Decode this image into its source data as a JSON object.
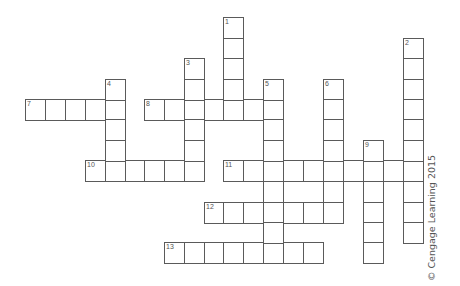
{
  "puzzle": {
    "grid_origin": {
      "x": 25,
      "y": 17
    },
    "col_x": [
      25,
      45,
      65,
      85,
      105,
      125,
      144,
      164,
      184,
      204,
      223,
      243,
      263,
      283,
      303,
      323,
      343,
      363,
      383,
      403
    ],
    "row_y": [
      17,
      38,
      58,
      79,
      99,
      119,
      140,
      160,
      181,
      202,
      222,
      242
    ],
    "cell_size": {
      "w": 21,
      "h": 22
    },
    "line_color": "#5a5a5a",
    "number_color": "#555555",
    "across": [
      {
        "number": "7",
        "row": 4,
        "col": 0,
        "length": 5
      },
      {
        "number": "8",
        "row": 4,
        "col": 6,
        "length": 7
      },
      {
        "number": "10",
        "row": 7,
        "col": 3,
        "length": 6
      },
      {
        "number": "11",
        "row": 7,
        "col": 10,
        "length": 10
      },
      {
        "number": "12",
        "row": 9,
        "col": 9,
        "length": 7
      },
      {
        "number": "13",
        "row": 11,
        "col": 7,
        "length": 8
      }
    ],
    "down": [
      {
        "number": "1",
        "row": 0,
        "col": 10,
        "length": 5
      },
      {
        "number": "2",
        "row": 1,
        "col": 19,
        "length": 10
      },
      {
        "number": "3",
        "row": 2,
        "col": 8,
        "length": 6
      },
      {
        "number": "4",
        "row": 3,
        "col": 4,
        "length": 5
      },
      {
        "number": "5",
        "row": 3,
        "col": 12,
        "length": 9
      },
      {
        "number": "6",
        "row": 3,
        "col": 15,
        "length": 7
      },
      {
        "number": "9",
        "row": 6,
        "col": 17,
        "length": 6
      }
    ]
  },
  "copyright": "© Cengage Learning 2015"
}
